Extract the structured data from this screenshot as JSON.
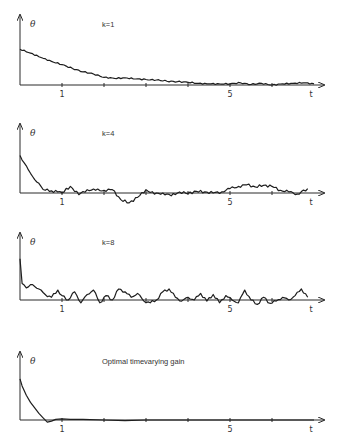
{
  "chart_data": [
    {
      "type": "line",
      "title": "k=1",
      "ylabel": "θ",
      "xlabel": "t",
      "xlim": [
        0,
        7
      ],
      "x_ticks": [
        1,
        2,
        3,
        4,
        5,
        6
      ],
      "x_tick_labels": {
        "1": "1",
        "5": "5"
      },
      "grid": false,
      "series": [
        {
          "name": "k=1",
          "x": [
            0,
            0.25,
            0.5,
            0.75,
            1.0,
            1.25,
            1.5,
            1.75,
            2.0,
            2.25,
            2.5,
            2.75,
            3.0,
            3.25,
            3.5,
            3.75,
            4.0,
            4.25,
            4.5,
            4.75,
            5.0,
            5.25,
            5.5,
            5.75,
            6.0,
            6.25,
            6.5,
            6.75,
            7.0
          ],
          "y": [
            0.65,
            0.58,
            0.5,
            0.43,
            0.37,
            0.3,
            0.24,
            0.2,
            0.14,
            0.12,
            0.13,
            0.11,
            0.1,
            0.09,
            0.07,
            0.06,
            0.05,
            0.03,
            0.02,
            0.02,
            0.02,
            0.04,
            0.01,
            0.03,
            0.0,
            0.02,
            0.03,
            0.04,
            0.02
          ]
        }
      ]
    },
    {
      "type": "line",
      "title": "k=4",
      "ylabel": "θ",
      "xlabel": "t",
      "xlim": [
        0,
        7
      ],
      "x_ticks": [
        1,
        2,
        3,
        4,
        5,
        6
      ],
      "x_tick_labels": {
        "1": "1",
        "5": "5"
      },
      "grid": false,
      "series": [
        {
          "name": "k=4",
          "x": [
            0,
            0.1,
            0.2,
            0.3,
            0.4,
            0.5,
            0.6,
            0.75,
            0.9,
            1.0,
            1.2,
            1.4,
            1.6,
            1.8,
            2.0,
            2.2,
            2.4,
            2.6,
            2.8,
            3.0,
            3.2,
            3.4,
            3.6,
            3.8,
            4.0,
            4.2,
            4.4,
            4.6,
            4.8,
            5.0,
            5.2,
            5.4,
            5.6,
            5.8,
            6.0,
            6.2,
            6.4,
            6.6,
            6.85
          ],
          "y": [
            0.68,
            0.55,
            0.42,
            0.3,
            0.2,
            0.12,
            0.05,
            0.04,
            0.02,
            0.0,
            0.12,
            -0.03,
            0.06,
            0.05,
            0.05,
            0.06,
            -0.12,
            -0.18,
            -0.08,
            0.06,
            -0.02,
            0.0,
            -0.05,
            0.02,
            -0.01,
            0.03,
            0.02,
            0.0,
            0.02,
            0.08,
            0.12,
            0.15,
            0.11,
            0.14,
            0.12,
            0.05,
            0.02,
            -0.02,
            0.08
          ]
        }
      ]
    },
    {
      "type": "line",
      "title": "k=8",
      "ylabel": "θ",
      "xlabel": "t",
      "xlim": [
        0,
        7
      ],
      "x_ticks": [
        1,
        2,
        3,
        4,
        5,
        6
      ],
      "x_tick_labels": {
        "1": "1",
        "5": "5"
      },
      "grid": false,
      "series": [
        {
          "name": "k=8",
          "x": [
            0,
            0.05,
            0.15,
            0.3,
            0.45,
            0.6,
            0.75,
            0.9,
            1.0,
            1.15,
            1.3,
            1.45,
            1.6,
            1.75,
            1.9,
            2.05,
            2.2,
            2.35,
            2.5,
            2.65,
            2.8,
            2.95,
            3.1,
            3.25,
            3.4,
            3.55,
            3.7,
            3.85,
            4.0,
            4.15,
            4.3,
            4.45,
            4.6,
            4.75,
            4.9,
            5.05,
            5.2,
            5.35,
            5.5,
            5.65,
            5.8,
            5.95,
            6.1,
            6.25,
            6.4,
            6.55,
            6.7,
            6.85
          ],
          "y": [
            0.75,
            0.3,
            0.22,
            0.28,
            0.2,
            0.1,
            0.05,
            0.18,
            0.08,
            0.0,
            0.15,
            -0.05,
            0.1,
            0.18,
            -0.05,
            0.08,
            0.0,
            0.2,
            0.15,
            0.05,
            0.12,
            -0.02,
            -0.05,
            0.0,
            0.15,
            0.2,
            0.05,
            -0.02,
            0.05,
            0.0,
            0.12,
            -0.02,
            0.1,
            -0.05,
            0.08,
            0.0,
            -0.05,
            0.18,
            0.0,
            -0.08,
            0.05,
            -0.06,
            -0.02,
            0.05,
            0.0,
            0.08,
            0.2,
            0.05
          ]
        }
      ]
    },
    {
      "type": "line",
      "title": "Optimal timevarying gain",
      "ylabel": "θ",
      "xlabel": "t",
      "xlim": [
        0,
        7
      ],
      "x_ticks": [
        1,
        2,
        3,
        4,
        5,
        6
      ],
      "x_tick_labels": {
        "1": "1",
        "5": "5"
      },
      "grid": false,
      "series": [
        {
          "name": "Optimal timevarying gain",
          "x": [
            0,
            0.05,
            0.15,
            0.25,
            0.35,
            0.45,
            0.55,
            0.65,
            0.75,
            0.85,
            1.0,
            1.2,
            1.5,
            2.0,
            2.5,
            3.0,
            3.5,
            4.0,
            5.0,
            6.0,
            7.0
          ],
          "y": [
            0.75,
            0.62,
            0.45,
            0.32,
            0.22,
            0.12,
            0.04,
            -0.04,
            -0.02,
            0.01,
            0.02,
            0.01,
            0.01,
            0.0,
            -0.01,
            0.0,
            0.0,
            0.0,
            0.0,
            0.0,
            0.0
          ]
        }
      ]
    }
  ]
}
